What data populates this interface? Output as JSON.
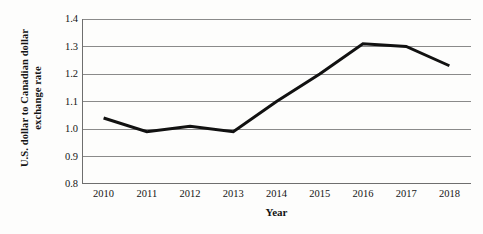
{
  "chart_data": {
    "type": "line",
    "title": "",
    "xlabel": "Year",
    "ylabel": "U.S. dollar to Canadian dollar exchange rate",
    "ylabel_line1": "U.S. dollar to Canadian dollar",
    "ylabel_line2": "exchange rate",
    "categories": [
      "2010",
      "2011",
      "2012",
      "2013",
      "2014",
      "2015",
      "2016",
      "2017",
      "2018"
    ],
    "values": [
      1.04,
      0.99,
      1.01,
      0.99,
      1.1,
      1.2,
      1.31,
      1.3,
      1.23
    ],
    "series": [
      {
        "name": "U.S. dollar to Canadian dollar exchange rate",
        "values": [
          1.04,
          0.99,
          1.01,
          0.99,
          1.1,
          1.2,
          1.31,
          1.3,
          1.23
        ]
      }
    ],
    "ylim": [
      0.8,
      1.4
    ],
    "yticks": [
      1.4,
      1.3,
      1.2,
      1.1,
      1.0,
      0.9,
      0.8
    ],
    "ytick_labels": [
      "1.4",
      "1.3",
      "1.2",
      "1.1",
      "1.0",
      "0.9",
      "0.8"
    ],
    "grid": true,
    "grid_axis": "y",
    "legend": false,
    "legend_position": "none",
    "line_color": "#111111",
    "grid_color": "#8a8a8a",
    "axis_color": "#6e6e6e",
    "background_color": "#fdfdfc"
  }
}
